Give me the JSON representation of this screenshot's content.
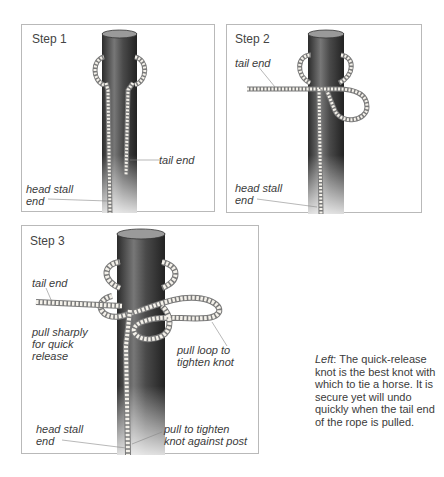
{
  "figure": {
    "steps": [
      {
        "label": "Step 1",
        "annotations": {
          "tail_end": "tail end",
          "head_stall_line1": "head stall",
          "head_stall_line2": "end"
        }
      },
      {
        "label": "Step 2",
        "annotations": {
          "tail_end": "tail end",
          "head_stall_line1": "head stall",
          "head_stall_line2": "end"
        }
      },
      {
        "label": "Step 3",
        "annotations": {
          "tail_end": "tail end",
          "pull_sharply_line1": "pull sharply",
          "pull_sharply_line2": "for quick",
          "pull_sharply_line3": "release",
          "pull_loop_line1": "pull loop to",
          "pull_loop_line2": "tighten knot",
          "head_stall_line1": "head stall",
          "head_stall_line2": "end",
          "pull_tighten_line1": "pull to tighten",
          "pull_tighten_line2": "knot against post"
        }
      }
    ],
    "caption": {
      "lead": "Left",
      "text": ": The quick-release knot is the best knot with which to tie a horse. It is secure yet will undo quickly when the tail end of the rope is pulled."
    }
  },
  "colors": {
    "post_dark": "#2e2e2e",
    "post_mid": "#6d6d6d",
    "post_light": "#bdbdbd",
    "rope": "#f4f1ea",
    "rope_outline": "#7a7a7a",
    "border": "#b9b9b9",
    "text": "#3b3b3b"
  }
}
